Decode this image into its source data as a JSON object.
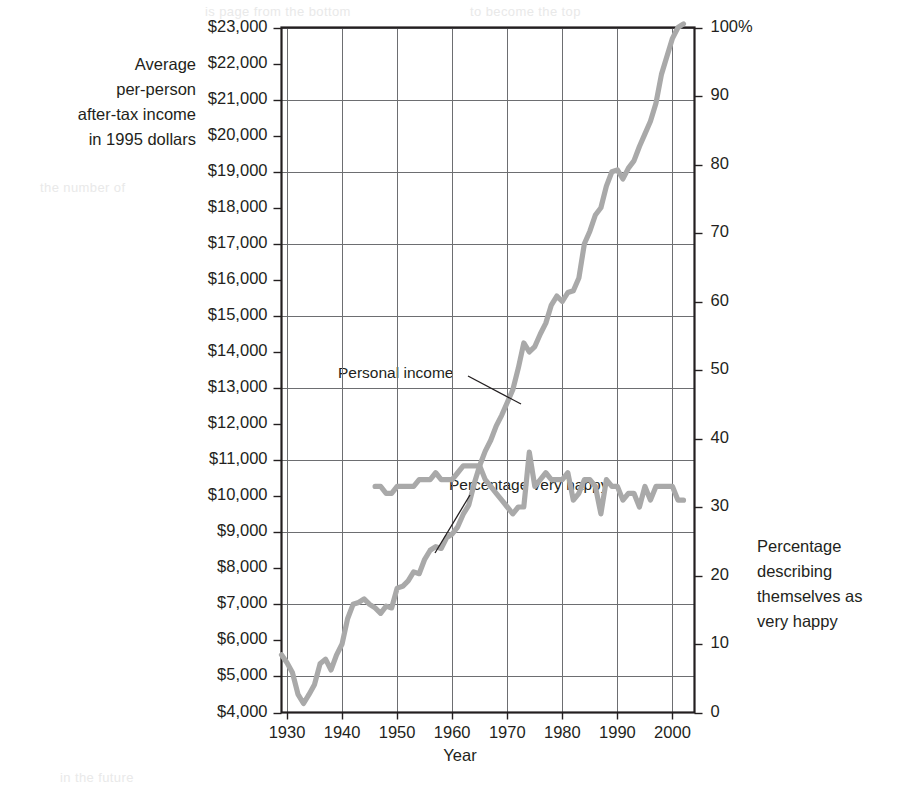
{
  "figure": {
    "background_color": "#ffffff",
    "line_color": "#a9a9a9",
    "grid_color": "#6d6e71",
    "frame_color": "#231f20",
    "text_color": "#231f20"
  },
  "axes": {
    "left_title": "Average\nper-person\nafter-tax income\nin 1995 dollars",
    "left_title_lines": [
      "Average",
      "per-person",
      "after-tax income",
      "in 1995 dollars"
    ],
    "right_title_lines": [
      "Percentage",
      "describing",
      "themselves as",
      "very happy"
    ],
    "x_title": "Year"
  },
  "annotations": [
    {
      "name": "personal-income",
      "text": "Personal income"
    },
    {
      "name": "percentage-very-happy",
      "text": "Percentage very happy"
    }
  ],
  "background_text": [
    "is page from the bottom",
    "to become the top",
    "the number of",
    "in the future"
  ],
  "chart_data": {
    "type": "line",
    "title": "",
    "xlabel": "Year",
    "ylabel": "Average per-person after-tax income in 1995 dollars",
    "y2label": "Percentage describing themselves as very happy",
    "xlim": [
      1929,
      2004
    ],
    "ylim": [
      4000,
      23000
    ],
    "y2lim": [
      0,
      100
    ],
    "grid": true,
    "legend": "annotated-inline",
    "xticks": [
      1930,
      1940,
      1950,
      1960,
      1970,
      1980,
      1990,
      2000
    ],
    "xticklabels": [
      "1930",
      "1940",
      "1950",
      "1960",
      "1970",
      "1980",
      "1990",
      "2000"
    ],
    "yticks": [
      4000,
      5000,
      6000,
      7000,
      8000,
      9000,
      10000,
      11000,
      12000,
      13000,
      14000,
      15000,
      16000,
      17000,
      18000,
      19000,
      20000,
      21000,
      22000,
      23000
    ],
    "yticklabels": [
      "$4,000",
      "$5,000",
      "$6,000",
      "$7,000",
      "$8,000",
      "$9,000",
      "$10,000",
      "$11,000",
      "$12,000",
      "$13,000",
      "$14,000",
      "$15,000",
      "$16,000",
      "$17,000",
      "$18,000",
      "$19,000",
      "$20,000",
      "$21,000",
      "$22,000",
      "$23,000"
    ],
    "y2ticks": [
      0,
      10,
      20,
      30,
      40,
      50,
      60,
      70,
      80,
      90,
      100
    ],
    "y2ticklabels": [
      "0",
      "10",
      "20",
      "30",
      "40",
      "50",
      "60",
      "70",
      "80",
      "90",
      "100%"
    ],
    "gridlines_y": [
      5000,
      7000,
      9000,
      11000,
      13000,
      15000,
      17000,
      19000,
      21000,
      23000
    ],
    "series": [
      {
        "name": "Personal income",
        "axis": "left",
        "color": "#a9a9a9",
        "x": [
          1929,
          1930,
          1931,
          1932,
          1933,
          1934,
          1935,
          1936,
          1937,
          1938,
          1939,
          1940,
          1941,
          1942,
          1943,
          1944,
          1945,
          1946,
          1947,
          1948,
          1949,
          1950,
          1951,
          1952,
          1953,
          1954,
          1955,
          1956,
          1957,
          1958,
          1959,
          1960,
          1961,
          1962,
          1963,
          1964,
          1965,
          1966,
          1967,
          1968,
          1969,
          1970,
          1971,
          1972,
          1973,
          1974,
          1975,
          1976,
          1977,
          1978,
          1979,
          1980,
          1981,
          1982,
          1983,
          1984,
          1985,
          1986,
          1987,
          1988,
          1989,
          1990,
          1991,
          1992,
          1993,
          1994,
          1995,
          1996,
          1997,
          1998,
          1999,
          2000,
          2001,
          2002
        ],
        "y": [
          5600,
          5380,
          5100,
          4500,
          4250,
          4500,
          4780,
          5350,
          5480,
          5180,
          5600,
          5900,
          6600,
          7000,
          7050,
          7150,
          7000,
          6900,
          6750,
          6950,
          6900,
          7450,
          7500,
          7650,
          7900,
          7850,
          8250,
          8500,
          8600,
          8550,
          8850,
          8950,
          9150,
          9500,
          9750,
          10350,
          10850,
          11250,
          11550,
          11950,
          12250,
          12600,
          12950,
          13550,
          14250,
          14000,
          14150,
          14500,
          14800,
          15300,
          15550,
          15400,
          15650,
          15700,
          16050,
          17000,
          17350,
          17800,
          18000,
          18600,
          19000,
          19050,
          18800,
          19100,
          19300,
          19700,
          20050,
          20400,
          20900,
          21700,
          22200,
          22700,
          23000,
          23100
        ]
      },
      {
        "name": "Percentage very happy",
        "axis": "right",
        "color": "#a9a9a9",
        "x": [
          1946,
          1947,
          1948,
          1949,
          1950,
          1951,
          1952,
          1953,
          1954,
          1955,
          1956,
          1957,
          1958,
          1959,
          1960,
          1961,
          1962,
          1963,
          1964,
          1965,
          1966,
          1967,
          1968,
          1969,
          1970,
          1971,
          1972,
          1973,
          1974,
          1975,
          1976,
          1977,
          1978,
          1979,
          1980,
          1981,
          1982,
          1983,
          1984,
          1985,
          1986,
          1987,
          1988,
          1989,
          1990,
          1991,
          1992,
          1993,
          1994,
          1995,
          1996,
          1997,
          1998,
          1999,
          2000,
          2001,
          2002
        ],
        "y": [
          33,
          33,
          32,
          32,
          33,
          33,
          33,
          33,
          34,
          34,
          34,
          35,
          34,
          34,
          34,
          35,
          36,
          36,
          36,
          36,
          34,
          33,
          32,
          31,
          30,
          29,
          30,
          30,
          38,
          33,
          34,
          35,
          34,
          34,
          34,
          35,
          31,
          32,
          34,
          34,
          33,
          29,
          34,
          33,
          33,
          31,
          32,
          32,
          30,
          33,
          31,
          33,
          33,
          33,
          33,
          31,
          31
        ]
      }
    ]
  }
}
